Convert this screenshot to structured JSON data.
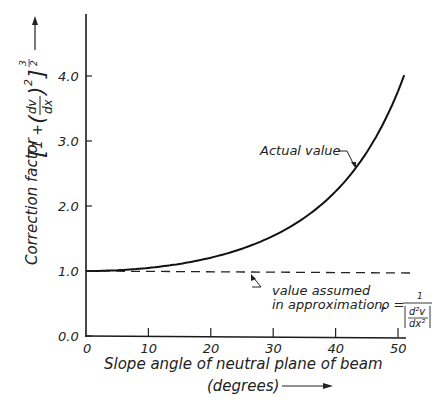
{
  "chart_data": {
    "type": "line",
    "title": "",
    "xlabel": "Slope angle of neutral plane of beam",
    "xlabel_units": "(degrees)",
    "ylabel": "Correction factor",
    "ylabel_formula": "[1 + (dv/dx)^2]^(3/2)",
    "xlim": [
      0,
      52
    ],
    "ylim": [
      0,
      5
    ],
    "x_ticks": [
      0,
      10,
      20,
      30,
      40,
      50
    ],
    "x_tick_labels": [
      "0",
      "10",
      "20",
      "30",
      "40",
      "50"
    ],
    "y_ticks": [
      0,
      1,
      2,
      3,
      4
    ],
    "y_tick_labels": [
      "0.0",
      "1.0",
      "2.0",
      "3.0",
      "4.0"
    ],
    "grid": false,
    "legend": "none (inline annotations)",
    "series": [
      {
        "name": "Actual value",
        "style": "solid",
        "x": [
          0,
          5,
          10,
          15,
          20,
          25,
          30,
          35,
          40,
          45,
          50,
          51
        ],
        "values": [
          1.0,
          1.011,
          1.047,
          1.11,
          1.205,
          1.343,
          1.54,
          1.819,
          2.224,
          2.828,
          3.765,
          3.97
        ]
      },
      {
        "name": "Value assumed in approximation",
        "style": "dashed",
        "x": [
          0,
          52
        ],
        "values": [
          1.0,
          1.0
        ]
      }
    ],
    "annotations": [
      {
        "text": "Actual value",
        "points_to": "solid curve near x=44"
      },
      {
        "text": "Value assumed in approximation,",
        "formula": "ρ = 1 / |d²v/dx²|",
        "points_to": "dashed line near x=28"
      }
    ]
  },
  "labels": {
    "y_axis_title": "Correction factor",
    "y_axis_formula_open": "[",
    "y_axis_formula_one_plus": "1 +",
    "y_axis_formula_dv": "dv",
    "y_axis_formula_dx": "dx",
    "y_axis_formula_sq": "2",
    "y_axis_formula_close": "]",
    "y_axis_formula_exp_num": "3",
    "y_axis_formula_exp_den": "2",
    "x_axis_title": "Slope angle of neutral plane of beam",
    "x_axis_units": "(degrees)",
    "actual_label": "Actual value",
    "approx_label_1": "value assumed",
    "approx_label_2": "in approximation,",
    "rho": "ρ =",
    "rho_num": "1",
    "rho_den_num": "d²v",
    "rho_den_den": "dx²"
  }
}
